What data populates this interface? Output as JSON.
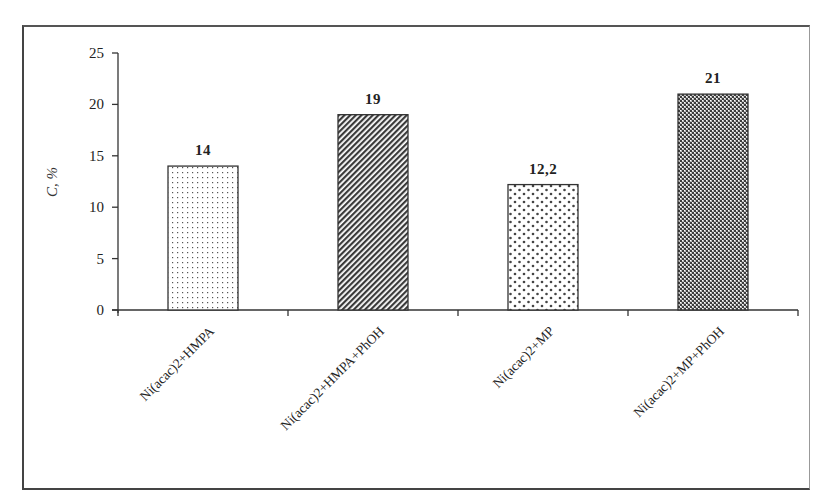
{
  "chart_data": {
    "type": "bar",
    "title": "",
    "xlabel": "",
    "ylabel": "C, %",
    "ylim": [
      0,
      25
    ],
    "yticks": [
      0,
      5,
      10,
      15,
      20,
      25
    ],
    "grid": false,
    "legend": null,
    "categories": [
      "Ni(acac)2+HMPA",
      "Ni(acac)2+HMPA+PhOH",
      "Ni(acac)2+MP",
      "Ni(acac)2+MP+PhOH"
    ],
    "values": [
      14,
      19,
      12.2,
      21
    ],
    "value_labels": [
      "14",
      "19",
      "12,2",
      "21"
    ],
    "patterns": [
      "fine-dots",
      "diagonal-hatch",
      "sparse-dots",
      "dense-wave"
    ]
  },
  "colors": {
    "axis": "#333333",
    "bar_outline": "#333333",
    "pattern_ink": "#444444",
    "background": "#ffffff"
  }
}
